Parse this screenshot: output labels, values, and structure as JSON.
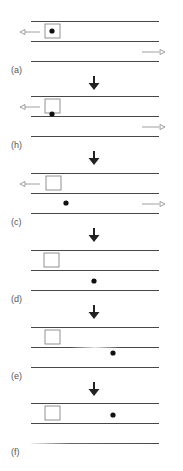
{
  "figure": {
    "panels": [
      {
        "label": "(a)",
        "top": 21,
        "box_x": 45,
        "dot": {
          "x": 52,
          "y": 10
        },
        "left_arrow": true,
        "right_arrow": true,
        "faded_middle": false,
        "faded_bottom": false
      },
      {
        "label": "(h)",
        "top": 96,
        "box_x": 45,
        "dot": {
          "x": 52,
          "y": 18
        },
        "left_arrow": true,
        "right_arrow": true,
        "faded_middle": false,
        "faded_bottom": false
      },
      {
        "label": "(c)",
        "top": 173,
        "box_x": 46,
        "dot": {
          "x": 66,
          "y": 30
        },
        "left_arrow": true,
        "right_arrow": true,
        "faded_middle": false,
        "faded_bottom": false
      },
      {
        "label": "(d)",
        "top": 250,
        "box_x": 44,
        "dot": {
          "x": 94,
          "y": 31
        },
        "left_arrow": false,
        "right_arrow": false,
        "faded_middle": false,
        "faded_bottom": false
      },
      {
        "label": "(e)",
        "top": 327,
        "box_x": 45,
        "dot": {
          "x": 113,
          "y": 26
        },
        "left_arrow": false,
        "right_arrow": false,
        "faded_middle": true,
        "faded_bottom": false
      },
      {
        "label": "(f)",
        "top": 403,
        "box_x": 45,
        "dot": {
          "x": 113,
          "y": 12
        },
        "left_arrow": false,
        "right_arrow": false,
        "faded_middle": false,
        "faded_bottom": true
      }
    ],
    "colors": {
      "line": "#333333",
      "box": "#777777",
      "dot": "#111111",
      "arrow": "#222222",
      "hollow_arrow": "#888888"
    }
  }
}
